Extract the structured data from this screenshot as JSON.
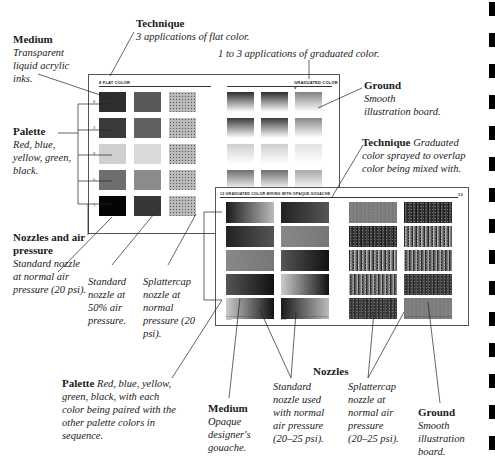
{
  "top_caption": "1 to 3 applications of graduated color.",
  "labels": {
    "medium_top": {
      "title": "Medium",
      "text": "Transparent liquid acrylic inks."
    },
    "technique_top": {
      "title": "Technique",
      "text": "3 applications of flat color."
    },
    "ground_top": {
      "title": "Ground",
      "text": "Smooth illustration board."
    },
    "palette_left": {
      "title": "Palette",
      "text": "Red, blue, yellow, green, black."
    },
    "technique_right": {
      "title": "Technique",
      "text": "Graduated color sprayed to overlap color being mixed with."
    },
    "nozzles_air": {
      "title": "Nozzles and air pressure",
      "text": "Standard nozzle at normal air pressure (20 psi)."
    },
    "standard_50": {
      "text": "Standard nozzle at 50% air pressure."
    },
    "splattercap_normal": {
      "text": "Splattercap nozzle at normal pressure (20 psi)."
    },
    "palette_bottom": {
      "title": "Palette",
      "text": "Red, blue, yellow, green, black, with each color being paired with the other palette colors in sequence."
    },
    "medium_bottom": {
      "title": "Medium",
      "text": "Opaque designer's gouache."
    },
    "nozzles_heading": "Nozzles",
    "standard_used": {
      "text": "Standard nozzle used with normal air pressure (20–25 psi)."
    },
    "splattercap_used": {
      "text": "Splattercap nozzle at normal air pressure (20–25 psi)."
    },
    "ground_bottom": {
      "title": "Ground",
      "text": "Smooth illustration board."
    }
  },
  "panel1": {
    "left_header": "8 FLAT COLOR",
    "right_header": "GRADUATED COLOR 9",
    "rows": [
      "#2e2e2e",
      "#3a3a3a",
      "#cfcfcf",
      "#6e6e6e",
      "#050505"
    ],
    "row_numbers": [
      "8",
      "3",
      "3",
      "5",
      "7"
    ]
  },
  "panel2": {
    "header": "12 GRADUATED COLOR MIXING WITH OPAQUE GOUACHE",
    "page_number": "13",
    "notes": [
      "Mixes: Graduated colors sprayed over flat color",
      "Mixes: Graduated colors sprayed over flat color",
      "Mixes: Splattercap nozzle graduated colors",
      "Mixes: Splattercap nozzle graduated colors"
    ]
  },
  "side_tabs": 15
}
